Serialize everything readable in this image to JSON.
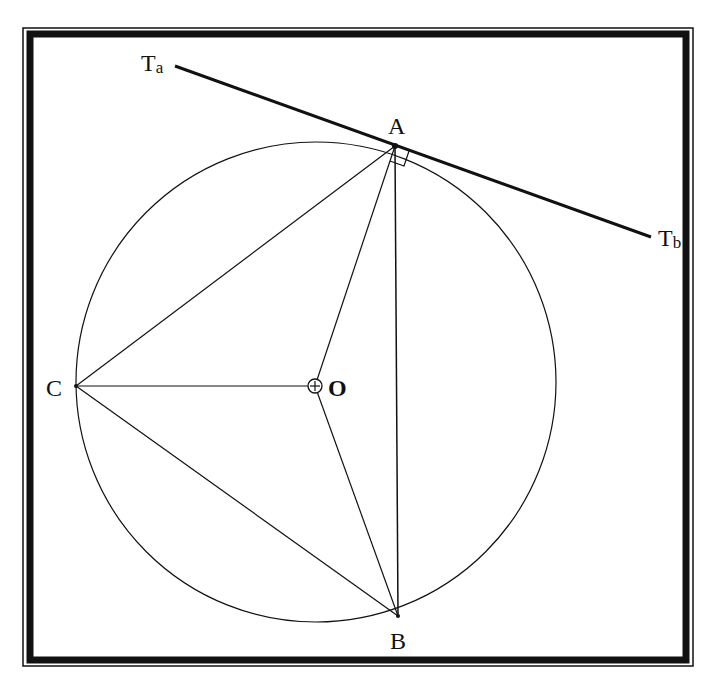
{
  "diagram": {
    "labels": {
      "A": "A",
      "B": "B",
      "C": "C",
      "O": "O",
      "Ta_main": "T",
      "Ta_sub": "a",
      "Tb_main": "T",
      "Tb_sub": "b"
    },
    "points": {
      "A": [
        395,
        146
      ],
      "B": [
        398,
        616
      ],
      "C": [
        76,
        386
      ],
      "O": [
        315,
        386
      ],
      "Ta": [
        175,
        66
      ],
      "Tb": [
        651,
        237
      ]
    },
    "circle": {
      "cx": 316,
      "cy": 382,
      "r": 240
    },
    "colors": {
      "stroke": "#111111",
      "frame": "#111111",
      "background": "#ffffff"
    }
  }
}
